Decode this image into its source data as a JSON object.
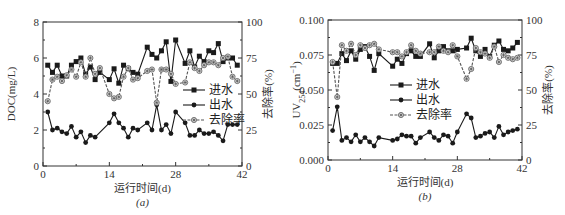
{
  "chart_data": [
    {
      "type": "line",
      "panel_label": "(a)",
      "title": "",
      "xlabel": "运行时间(d)",
      "ylabel": "DOC(mg/L)",
      "ylabel_right": "去除率(%)",
      "xlim": [
        0,
        42
      ],
      "ylim": [
        0,
        8
      ],
      "ylim_right": [
        0,
        100
      ],
      "xticks": [
        0,
        14,
        28,
        42
      ],
      "yticks": [
        0,
        2,
        4,
        6,
        8
      ],
      "yticks_right": [
        0,
        25,
        50,
        75,
        100
      ],
      "grid": false,
      "legend": {
        "position": "center-right",
        "entries": [
          "进水",
          "出水",
          "去除率"
        ]
      },
      "series": [
        {
          "name": "进水",
          "axis": "left",
          "marker": "square",
          "x": [
            1,
            2,
            3,
            4,
            5,
            6,
            7,
            8,
            9,
            10,
            11,
            12,
            14,
            15,
            16,
            17,
            18,
            19,
            20,
            22,
            23,
            24,
            25,
            26,
            27,
            28,
            30,
            31,
            32,
            33,
            34,
            35,
            36,
            37,
            38,
            39,
            40,
            41
          ],
          "values": [
            5.6,
            5.2,
            5.6,
            5.0,
            5.0,
            5.6,
            5.8,
            6.0,
            5.1,
            5.5,
            4.8,
            5.2,
            4.8,
            5.4,
            4.6,
            5.6,
            5.4,
            5.2,
            5.1,
            6.6,
            6.2,
            6.0,
            6.4,
            6.9,
            4.7,
            7.0,
            5.7,
            6.4,
            5.5,
            6.1,
            5.8,
            6.4,
            6.3,
            6.8,
            5.8,
            6.0,
            6.0,
            5.6
          ]
        },
        {
          "name": "出水",
          "axis": "left",
          "marker": "circle",
          "x": [
            1,
            2,
            3,
            4,
            5,
            6,
            7,
            8,
            9,
            10,
            11,
            14,
            15,
            16,
            17,
            18,
            19,
            20,
            22,
            23,
            24,
            25,
            26,
            27,
            28,
            30,
            31,
            32,
            33,
            34,
            35,
            36,
            37,
            38,
            39,
            40,
            41
          ],
          "values": [
            3.0,
            2.0,
            2.1,
            1.9,
            1.8,
            2.2,
            1.6,
            1.9,
            1.3,
            1.7,
            1.6,
            2.4,
            2.9,
            2.4,
            2.1,
            1.6,
            2.1,
            2.0,
            2.4,
            2.0,
            3.4,
            2.0,
            2.3,
            1.8,
            3.0,
            2.4,
            1.7,
            1.7,
            2.0,
            1.8,
            1.8,
            1.9,
            1.7,
            1.4,
            2.3,
            2.3,
            2.3
          ]
        },
        {
          "name": "去除率",
          "axis": "right",
          "marker": "star",
          "x": [
            1,
            2,
            3,
            4,
            5,
            6,
            7,
            8,
            9,
            10,
            11,
            12,
            14,
            15,
            16,
            17,
            18,
            19,
            20,
            22,
            23,
            24,
            25,
            26,
            27,
            28,
            30,
            31,
            32,
            33,
            34,
            35,
            36,
            37,
            38,
            39,
            40,
            41
          ],
          "values": [
            45,
            60,
            62,
            59,
            63,
            67,
            62,
            72,
            62,
            75,
            64,
            68,
            50,
            47,
            48,
            62,
            68,
            60,
            61,
            66,
            67,
            44,
            67,
            67,
            64,
            57,
            58,
            72,
            68,
            66,
            70,
            72,
            72,
            70,
            75,
            76,
            62,
            59
          ]
        }
      ]
    },
    {
      "type": "line",
      "panel_label": "(b)",
      "title": "",
      "xlabel": "运行时间(d)",
      "ylabel": "UV254(cm⁻¹)",
      "ylabel_right": "去除率(%)",
      "xlim": [
        0,
        42
      ],
      "ylim": [
        0,
        0.1
      ],
      "ylim_right": [
        0,
        100
      ],
      "xticks": [
        0,
        14,
        28,
        42
      ],
      "yticks": [
        0.0,
        0.025,
        0.05,
        0.075,
        0.1
      ],
      "yticks_right": [
        0,
        25,
        50,
        75,
        100
      ],
      "grid": false,
      "legend": {
        "position": "center",
        "entries": [
          "进水",
          "出水",
          "去除率"
        ]
      },
      "series": [
        {
          "name": "进水",
          "axis": "left",
          "marker": "square",
          "x": [
            1,
            2,
            3,
            4,
            5,
            6,
            7,
            8,
            9,
            10,
            11,
            14,
            15,
            16,
            17,
            18,
            19,
            20,
            22,
            23,
            24,
            25,
            26,
            27,
            28,
            30,
            31,
            32,
            33,
            34,
            35,
            36,
            37,
            38,
            39,
            40,
            41
          ],
          "values": [
            0.069,
            0.069,
            0.076,
            0.071,
            0.078,
            0.072,
            0.079,
            0.081,
            0.074,
            0.064,
            0.076,
            0.067,
            0.072,
            0.069,
            0.076,
            0.078,
            0.074,
            0.074,
            0.083,
            0.073,
            0.078,
            0.081,
            0.078,
            0.078,
            0.079,
            0.08,
            0.087,
            0.078,
            0.074,
            0.079,
            0.074,
            0.082,
            0.085,
            0.079,
            0.078,
            0.08,
            0.084
          ]
        },
        {
          "name": "出水",
          "axis": "left",
          "marker": "circle",
          "x": [
            1,
            2,
            3,
            4,
            5,
            6,
            7,
            8,
            9,
            10,
            11,
            14,
            15,
            16,
            17,
            18,
            19,
            20,
            22,
            23,
            24,
            25,
            26,
            27,
            28,
            30,
            31,
            32,
            33,
            34,
            35,
            36,
            37,
            38,
            39,
            40,
            41
          ],
          "values": [
            0.021,
            0.038,
            0.014,
            0.016,
            0.013,
            0.018,
            0.013,
            0.016,
            0.013,
            0.01,
            0.016,
            0.014,
            0.015,
            0.018,
            0.017,
            0.017,
            0.012,
            0.016,
            0.02,
            0.016,
            0.014,
            0.018,
            0.017,
            0.012,
            0.02,
            0.033,
            0.03,
            0.016,
            0.017,
            0.019,
            0.02,
            0.016,
            0.024,
            0.018,
            0.02,
            0.021,
            0.022
          ]
        },
        {
          "name": "去除率",
          "axis": "right",
          "marker": "star",
          "x": [
            1,
            2,
            3,
            4,
            5,
            6,
            7,
            8,
            9,
            10,
            11,
            14,
            15,
            16,
            17,
            18,
            19,
            20,
            22,
            23,
            24,
            25,
            26,
            27,
            28,
            30,
            31,
            32,
            33,
            34,
            35,
            36,
            37,
            38,
            39,
            40,
            41
          ],
          "values": [
            70,
            45,
            82,
            78,
            83,
            75,
            82,
            80,
            82,
            83,
            79,
            77,
            77,
            74,
            77,
            82,
            78,
            76,
            77,
            77,
            81,
            78,
            77,
            82,
            74,
            58,
            65,
            80,
            77,
            76,
            73,
            81,
            70,
            75,
            73,
            72,
            73
          ]
        }
      ]
    }
  ],
  "panels": {
    "a": {
      "ylabel": "DOC(mg/L)",
      "ylabel_right": "去除率(%)",
      "xlabel": "运行时间(d)",
      "caption": "(a)",
      "legend": [
        "进水",
        "出水",
        "去除率"
      ],
      "xticks": [
        "0",
        "14",
        "28",
        "42"
      ],
      "yticks": [
        "0",
        "2",
        "4",
        "6",
        "8"
      ],
      "yticks_right": [
        "0",
        "25",
        "50",
        "75",
        "100"
      ]
    },
    "b": {
      "ylabel": "UV254(cm⁻¹)",
      "ylabel_right": "去除率(%)",
      "xlabel": "运行时间(d)",
      "caption": "(b)",
      "legend": [
        "进水",
        "出水",
        "去除率"
      ],
      "xticks": [
        "0",
        "14",
        "28",
        "42"
      ],
      "yticks": [
        "0.000",
        "0.025",
        "0.050",
        "0.075",
        "0.100"
      ],
      "yticks_right": [
        "0",
        "25",
        "50",
        "75",
        "100"
      ]
    }
  },
  "colors": {
    "line": "#1a1a1a",
    "rate": "#555555",
    "axis": "#333333"
  }
}
